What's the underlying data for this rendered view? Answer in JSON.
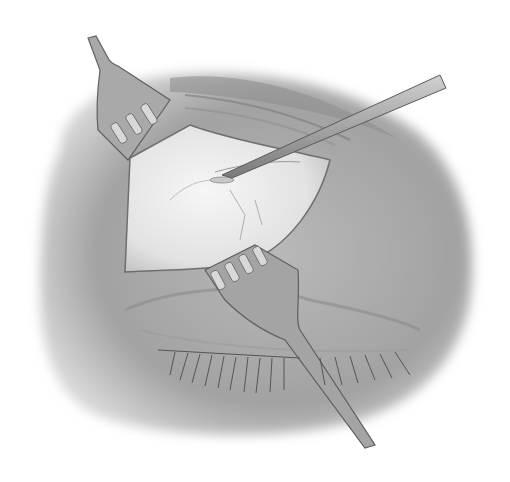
{
  "illustration": {
    "subject": "surgical-eye-illustration",
    "style": "grayscale pencil drawing",
    "elements": [
      "upper-retractor",
      "lower-retractor",
      "probe-instrument",
      "exposed-tissue",
      "eyelashes",
      "skin-region"
    ]
  },
  "colors": {
    "background": "#ffffff",
    "skin_dark": "#8a8a8a",
    "skin_mid": "#a8a8a8",
    "skin_light": "#cfcfcf",
    "tissue": "#ececec",
    "instrument": "#9a9a9a",
    "outline": "#555555"
  }
}
